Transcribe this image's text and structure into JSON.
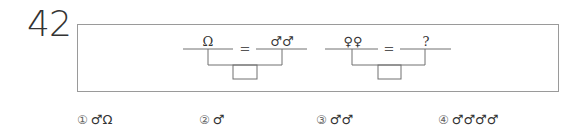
{
  "question_number": "42",
  "diagram": {
    "equation1": {
      "left": "Ω",
      "equals": "=",
      "right": "♂♂"
    },
    "equation2": {
      "left": "♀♀",
      "equals": "=",
      "right": "?"
    }
  },
  "choices": [
    {
      "number": "①",
      "text": "♂Ω"
    },
    {
      "number": "②",
      "text": "♂"
    },
    {
      "number": "③",
      "text": "♂♂"
    },
    {
      "number": "④",
      "text": "♂♂♂♂"
    }
  ]
}
